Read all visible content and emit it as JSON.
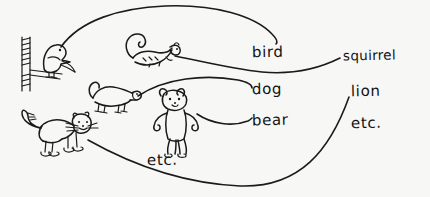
{
  "diagram": {
    "style": "hand-drawn pen sketch on paper",
    "background_color": "#f7f7f6",
    "ink_color": "#1a1a1a"
  },
  "pictures": [
    {
      "id": "bird",
      "name": "bird-drawing",
      "description": "bird perched on a branch",
      "x": 14,
      "y": 36
    },
    {
      "id": "squirrel",
      "name": "squirrel-drawing",
      "description": "squirrel with bushy curled tail",
      "x": 118,
      "y": 34
    },
    {
      "id": "dog",
      "name": "dog-drawing",
      "description": "small standing dog",
      "x": 86,
      "y": 78
    },
    {
      "id": "bear",
      "name": "bear-drawing",
      "description": "teddy bear standing upright",
      "x": 152,
      "y": 86
    },
    {
      "id": "lion",
      "name": "lion-drawing",
      "description": "lion with curled tail and whiskers",
      "x": 16,
      "y": 108
    }
  ],
  "labels": [
    {
      "id": "bird",
      "text": "bird",
      "x": 252,
      "y": 45,
      "size": "normal"
    },
    {
      "id": "squirrel",
      "text": "squirrel",
      "x": 343,
      "y": 49,
      "size": "small"
    },
    {
      "id": "dog",
      "text": "dog",
      "x": 252,
      "y": 82,
      "size": "normal"
    },
    {
      "id": "lion",
      "text": "lion",
      "x": 351,
      "y": 84,
      "size": "normal"
    },
    {
      "id": "bear",
      "text": "bear",
      "x": 252,
      "y": 113,
      "size": "normal"
    },
    {
      "id": "etc_right",
      "text": "etc.",
      "x": 351,
      "y": 116,
      "size": "normal"
    },
    {
      "id": "etc_mid",
      "text": "etc.",
      "x": 147,
      "y": 153,
      "size": "normal"
    }
  ],
  "connections": [
    {
      "id": "bird-to-bird",
      "from": "bird-drawing",
      "to": "bird-label",
      "shape": "tall arc over the top"
    },
    {
      "id": "squirrel-to-squirrel",
      "from": "squirrel-drawing",
      "to": "squirrel-label",
      "shape": "shallow S dipping under bird"
    },
    {
      "id": "dog-to-dog",
      "from": "dog-drawing",
      "to": "dog-label",
      "shape": "low arc"
    },
    {
      "id": "bear-to-bear",
      "from": "bear-drawing",
      "to": "bear-label",
      "shape": "shallow sag"
    },
    {
      "id": "lion-to-lion",
      "from": "lion-drawing",
      "to": "lion-label",
      "shape": "long sweeping U curve along the bottom"
    }
  ]
}
